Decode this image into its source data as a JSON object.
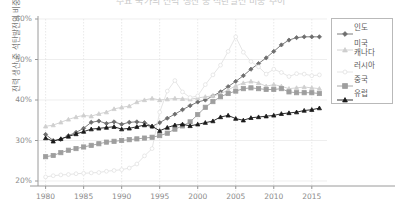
{
  "chart_data": {
    "type": "line",
    "title": "주요 국가의 전력 생산 중 석탄발전 비중 추이",
    "xlabel": "",
    "ylabel": "전력 생산 중 석탄발전의 비중",
    "xlim": [
      1979,
      2017
    ],
    "ylim": [
      20,
      60
    ],
    "xticks": [
      1980,
      1985,
      1990,
      1995,
      2000,
      2005,
      2010,
      2015
    ],
    "yticks": [
      20,
      30,
      40,
      50,
      60
    ],
    "ytick_labels": [
      "20%",
      "30%",
      "40%",
      "50%",
      "60%"
    ],
    "grid": true,
    "legend_position": "right",
    "x": [
      1980,
      1981,
      1982,
      1983,
      1984,
      1985,
      1986,
      1987,
      1988,
      1989,
      1990,
      1991,
      1992,
      1993,
      1994,
      1995,
      1996,
      1997,
      1998,
      1999,
      2000,
      2001,
      2002,
      2003,
      2004,
      2005,
      2006,
      2007,
      2008,
      2009,
      2010,
      2011,
      2012,
      2013,
      2014,
      2015,
      2016
    ],
    "series": [
      {
        "name": "인도",
        "color": "#6e6e6e",
        "marker": "diamond",
        "values": [
          31.5,
          30.0,
          30.3,
          31.2,
          32.0,
          33.0,
          34.5,
          34.8,
          34.2,
          34.6,
          34.0,
          34.5,
          34.6,
          34.4,
          33.5,
          34.4,
          35.5,
          36.5,
          37.6,
          38.6,
          39.5,
          40.0,
          41.0,
          42.0,
          43.3,
          44.6,
          46.0,
          47.6,
          49.0,
          50.4,
          52.0,
          53.6,
          54.8,
          55.4,
          55.6,
          55.6,
          55.6
        ]
      },
      {
        "name": "미국\n캐나다",
        "color": "#cfcfcf",
        "marker": "triangle",
        "values": [
          33.5,
          33.8,
          34.5,
          35.2,
          35.8,
          36.2,
          36.0,
          36.6,
          37.0,
          37.8,
          38.2,
          38.5,
          39.5,
          40.0,
          40.4,
          40.0,
          40.2,
          40.4,
          40.3,
          40.2,
          40.5,
          40.8,
          41.0,
          41.5,
          42.5,
          43.5,
          44.2,
          44.6,
          44.2,
          43.4,
          43.8,
          43.4,
          42.8,
          43.0,
          43.2,
          43.0,
          42.8
        ]
      },
      {
        "name": "러시아",
        "color": "#e2e2e2",
        "marker": "circle",
        "values": [
          21.0,
          21.3,
          21.5,
          21.6,
          21.8,
          21.9,
          22.0,
          22.1,
          22.4,
          22.6,
          22.8,
          23.2,
          24.2,
          26.2,
          28.0,
          37.0,
          42.2,
          44.8,
          42.0,
          40.6,
          41.0,
          43.8,
          46.2,
          48.6,
          52.0,
          55.6,
          51.8,
          49.5,
          48.2,
          46.4,
          47.6,
          46.8,
          45.8,
          46.5,
          46.4,
          46.0,
          46.2
        ]
      },
      {
        "name": "중국",
        "color": "#9e9e9e",
        "marker": "square",
        "values": [
          26.0,
          26.3,
          27.0,
          27.6,
          28.0,
          28.4,
          28.8,
          29.2,
          29.6,
          29.8,
          30.0,
          30.2,
          30.4,
          30.6,
          30.8,
          31.2,
          31.8,
          32.8,
          33.6,
          34.6,
          36.4,
          38.2,
          39.6,
          40.8,
          41.6,
          42.2,
          42.8,
          43.0,
          42.8,
          42.6,
          42.6,
          42.8,
          42.0,
          41.8,
          41.8,
          41.8,
          41.6
        ]
      },
      {
        "name": "유럽",
        "color": "#1a1a1a",
        "marker": "triangle",
        "values": [
          30.6,
          29.8,
          30.4,
          31.0,
          31.6,
          32.2,
          32.8,
          33.0,
          33.2,
          33.4,
          32.8,
          33.0,
          33.4,
          33.8,
          33.5,
          32.4,
          33.2,
          33.8,
          34.0,
          33.6,
          34.0,
          34.4,
          34.8,
          35.8,
          36.2,
          35.4,
          35.0,
          35.6,
          35.8,
          36.0,
          36.2,
          36.6,
          36.8,
          37.0,
          37.4,
          37.6,
          38.0
        ]
      }
    ]
  }
}
